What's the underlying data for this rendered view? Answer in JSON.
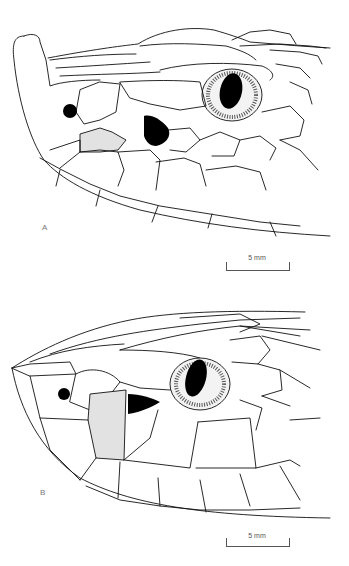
{
  "figure": {
    "panels": [
      {
        "id": "A",
        "label": "A",
        "scale_bar": {
          "text": "5 mm"
        }
      },
      {
        "id": "B",
        "label": "B",
        "scale_bar": {
          "text": "5 mm"
        }
      }
    ],
    "colors": {
      "line": "#111111",
      "highlight_scale_fill": "#e2e2e2",
      "background": "#ffffff"
    }
  }
}
